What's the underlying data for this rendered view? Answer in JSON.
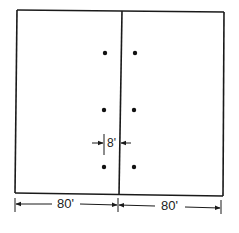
{
  "diagram": {
    "type": "plan-view",
    "colors": {
      "line": "#1a1a1a",
      "background": "#ffffff"
    },
    "outline": {
      "x1": 16,
      "y1": 10,
      "x2": 223,
      "y2": 196
    },
    "divider": {
      "x": 119
    },
    "points": [
      {
        "x": 105,
        "y": 53
      },
      {
        "x": 135,
        "y": 53
      },
      {
        "x": 104,
        "y": 110
      },
      {
        "x": 134,
        "y": 110
      },
      {
        "x": 104,
        "y": 167
      },
      {
        "x": 134,
        "y": 167
      }
    ],
    "dimensions": {
      "left_width": "80'",
      "right_width": "80'",
      "spacing": "8'"
    }
  }
}
